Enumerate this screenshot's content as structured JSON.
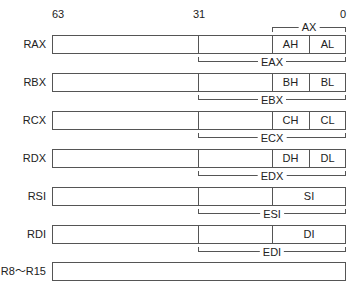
{
  "bits": {
    "b63": "63",
    "b31": "31",
    "b0": "0"
  },
  "ax_label": "AX",
  "registers": [
    {
      "name": "RAX",
      "e": "EAX",
      "high": "AH",
      "low": "AL"
    },
    {
      "name": "RBX",
      "e": "EBX",
      "high": "BH",
      "low": "BL"
    },
    {
      "name": "RCX",
      "e": "ECX",
      "high": "CH",
      "low": "CL"
    },
    {
      "name": "RDX",
      "e": "EDX",
      "high": "DH",
      "low": "DL"
    },
    {
      "name": "RSI",
      "e": "ESI",
      "word": "SI"
    },
    {
      "name": "RDI",
      "e": "EDI",
      "word": "DI"
    },
    {
      "name": "R8～R15"
    }
  ]
}
